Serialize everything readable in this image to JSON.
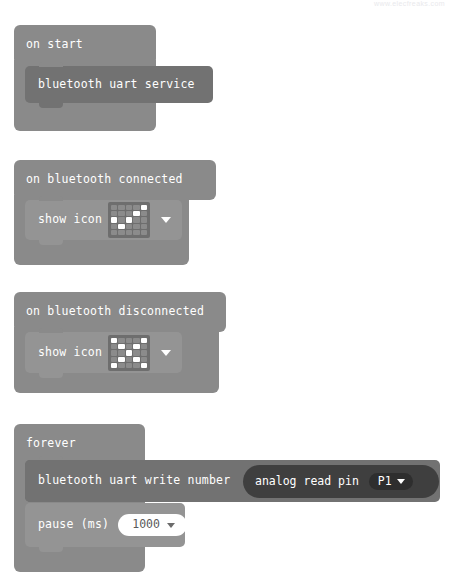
{
  "meta": {
    "watermark": "www.elecfreaks.com",
    "background": "#ffffff",
    "canvas_width": 449,
    "canvas_height": 576
  },
  "palette": {
    "event_block": "#8a8a8a",
    "bluetooth_block": "#727272",
    "basic_block": "#949494",
    "loop_block": "#8a8a8a",
    "reporter_block": "#3f3f3f",
    "field_dark": "#2e2e2e",
    "field_white": "#ffffff",
    "led_off": "#8b8b8b",
    "led_on": "#ffffff",
    "text": "#ffffff",
    "field_text_dark": "#5a5a5a"
  },
  "blocks": {
    "on_start": {
      "header_label": "on start",
      "children": [
        {
          "label": "bluetooth uart service"
        }
      ]
    },
    "on_bluetooth_connected": {
      "header_label": "on bluetooth connected",
      "children": [
        {
          "label": "show icon",
          "icon_name": "yes-icon",
          "icon_pattern": [
            [
              0,
              0,
              0,
              0,
              1
            ],
            [
              0,
              0,
              0,
              1,
              0
            ],
            [
              1,
              0,
              1,
              0,
              0
            ],
            [
              0,
              1,
              0,
              0,
              0
            ],
            [
              0,
              0,
              0,
              0,
              0
            ]
          ],
          "dropdown": "icon-dropdown"
        }
      ]
    },
    "on_bluetooth_disconnected": {
      "header_label": "on bluetooth disconnected",
      "children": [
        {
          "label": "show icon",
          "icon_name": "no-icon",
          "icon_pattern": [
            [
              1,
              0,
              0,
              0,
              1
            ],
            [
              0,
              1,
              0,
              1,
              0
            ],
            [
              0,
              0,
              1,
              0,
              0
            ],
            [
              0,
              1,
              0,
              1,
              0
            ],
            [
              1,
              0,
              0,
              0,
              1
            ]
          ],
          "dropdown": "icon-dropdown"
        }
      ]
    },
    "forever": {
      "header_label": "forever",
      "children": [
        {
          "label": "bluetooth uart write number",
          "reporter": {
            "label": "analog read pin",
            "field_value": "P1"
          }
        },
        {
          "label": "pause (ms)",
          "field_value": "1000"
        }
      ]
    }
  }
}
